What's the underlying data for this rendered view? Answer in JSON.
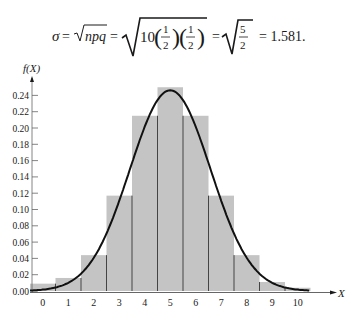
{
  "formula": {
    "sigma": "σ",
    "eq": "=",
    "sqrt_npq": "npq",
    "ten": "10",
    "half_num": "1",
    "half_den": "2",
    "five": "5",
    "two": "2",
    "result": "= 1.581."
  },
  "chart_data": {
    "type": "bar",
    "title": "",
    "xlabel": "X",
    "ylabel": "f(X)",
    "categories": [
      "0",
      "1",
      "2",
      "3",
      "4",
      "5",
      "6",
      "7",
      "8",
      "9",
      "10"
    ],
    "values": [
      0.009,
      0.016,
      0.044,
      0.117,
      0.215,
      0.25,
      0.215,
      0.117,
      0.044,
      0.011,
      0.004
    ],
    "overlay": {
      "type": "normal-curve",
      "mean": 5,
      "sd": 1.581,
      "peak": 0.25
    },
    "yticks": [
      "0.00",
      "0.02",
      "0.04",
      "0.06",
      "0.08",
      "0.10",
      "0.12",
      "0.14",
      "0.16",
      "0.18",
      "0.20",
      "0.22",
      "0.24"
    ],
    "ylim": [
      0,
      0.26
    ],
    "grid": false,
    "bar_color": "#c4c4c4",
    "edge_color": "#444444",
    "curve_color": "#111111"
  }
}
